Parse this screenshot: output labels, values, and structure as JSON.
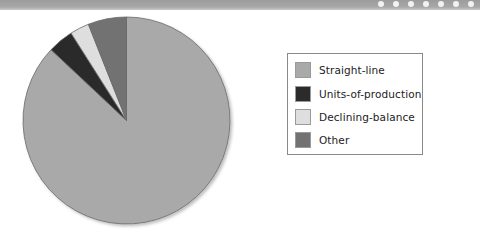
{
  "header": {
    "dot_count": 7
  },
  "chart_data": {
    "type": "pie",
    "title": "",
    "categories": [
      "Straight-line",
      "Units-of-production",
      "Declining-balance",
      "Other"
    ],
    "values": [
      87,
      4,
      3,
      6
    ],
    "unit": "percent (estimated from slice angles)",
    "colors": [
      "#a9a9a9",
      "#2b2b2b",
      "#dedede",
      "#727272"
    ],
    "start_angle": "12 o'clock, clockwise",
    "legend_position": "right"
  },
  "legend": {
    "items": [
      {
        "label": "Straight-line",
        "color": "#a9a9a9"
      },
      {
        "label": "Units-of-production",
        "color": "#2b2b2b"
      },
      {
        "label": "Declining-balance",
        "color": "#dedede"
      },
      {
        "label": "Other",
        "color": "#727272"
      }
    ]
  }
}
